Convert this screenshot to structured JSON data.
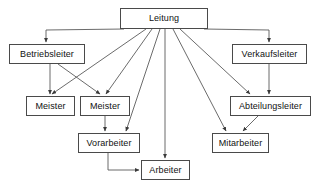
{
  "diagram": {
    "background_color": "#ffffff",
    "line_color": "#5a5a5a",
    "box_border_color": "#4a4a4a",
    "box_fill_color": "#ffffff",
    "text_color": "#111111",
    "nodes": [
      {
        "id": "leitung",
        "label": "Leitung",
        "x": 120,
        "y": 8,
        "w": 88,
        "h": 21
      },
      {
        "id": "betriebsleiter",
        "label": "Betriebsleiter",
        "x": 9,
        "y": 44,
        "w": 76,
        "h": 20
      },
      {
        "id": "verkaufsleiter",
        "label": "Verkaufsleiter",
        "x": 232,
        "y": 44,
        "w": 75,
        "h": 20
      },
      {
        "id": "meister1",
        "label": "Meister",
        "x": 26,
        "y": 96,
        "w": 49,
        "h": 20
      },
      {
        "id": "meister2",
        "label": "Meister",
        "x": 80,
        "y": 96,
        "w": 50,
        "h": 20
      },
      {
        "id": "abteilungsleiter",
        "label": "Abteilungsleiter",
        "x": 230,
        "y": 96,
        "w": 81,
        "h": 20
      },
      {
        "id": "vorarbeiter",
        "label": "Vorarbeiter",
        "x": 78,
        "y": 133,
        "w": 62,
        "h": 20
      },
      {
        "id": "mitarbeiter",
        "label": "Mitarbeiter",
        "x": 212,
        "y": 133,
        "w": 57,
        "h": 20
      },
      {
        "id": "arbeiter",
        "label": "Arbeiter",
        "x": 141,
        "y": 160,
        "w": 49,
        "h": 20
      }
    ],
    "edges": [
      {
        "from": "leitung",
        "to": "betriebsleiter",
        "style": "orthogonal-left"
      },
      {
        "from": "leitung",
        "to": "verkaufsleiter",
        "style": "orthogonal-right"
      },
      {
        "from": "leitung",
        "to": "meister1",
        "style": "diagonal"
      },
      {
        "from": "leitung",
        "to": "meister2",
        "style": "diagonal"
      },
      {
        "from": "leitung",
        "to": "vorarbeiter",
        "style": "diagonal"
      },
      {
        "from": "leitung",
        "to": "arbeiter",
        "style": "vertical"
      },
      {
        "from": "leitung",
        "to": "mitarbeiter",
        "style": "diagonal"
      },
      {
        "from": "leitung",
        "to": "abteilungsleiter",
        "style": "diagonal"
      },
      {
        "from": "betriebsleiter",
        "to": "meister1",
        "style": "vertical"
      },
      {
        "from": "betriebsleiter",
        "to": "meister2",
        "style": "diagonal"
      },
      {
        "from": "verkaufsleiter",
        "to": "abteilungsleiter",
        "style": "vertical"
      },
      {
        "from": "abteilungsleiter",
        "to": "mitarbeiter",
        "style": "diagonal"
      },
      {
        "from": "meister2",
        "to": "vorarbeiter",
        "style": "vertical"
      },
      {
        "from": "vorarbeiter",
        "to": "arbeiter",
        "style": "orthogonal-down-right"
      }
    ]
  }
}
